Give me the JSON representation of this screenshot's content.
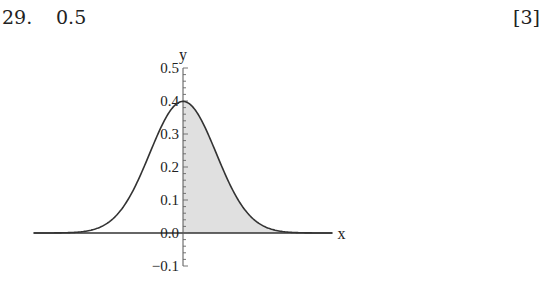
{
  "question": {
    "number": "29.",
    "answer": "0.5",
    "marks": "[3]"
  },
  "chart_data": {
    "type": "area",
    "title": "",
    "xlabel": "x",
    "ylabel": "y",
    "yticks": [
      -0.1,
      0.0,
      0.1,
      0.2,
      0.3,
      0.4,
      0.5
    ],
    "ytick_labels": [
      "−0.1",
      "0.0",
      "0.1",
      "0.2",
      "0.3",
      "0.4",
      "0.5"
    ],
    "ylim": [
      -0.1,
      0.5
    ],
    "xlim": [
      -4.5,
      4.5
    ],
    "x": [
      -4.5,
      -4,
      -3.5,
      -3,
      -2.5,
      -2,
      -1.5,
      -1,
      -0.5,
      0,
      0.5,
      1,
      1.5,
      2,
      2.5,
      3,
      3.5,
      4,
      4.5
    ],
    "series": [
      {
        "name": "normal density",
        "values": [
          0.0,
          0.0001,
          0.0009,
          0.0044,
          0.0175,
          0.054,
          0.1295,
          0.242,
          0.3521,
          0.3989,
          0.3521,
          0.242,
          0.1295,
          0.054,
          0.0175,
          0.0044,
          0.0009,
          0.0001,
          0.0
        ]
      }
    ],
    "shaded_region": {
      "from": 0,
      "to": 4.5,
      "area": 0.5,
      "color": "#e0e0e0"
    },
    "grid": false,
    "legend": null
  }
}
